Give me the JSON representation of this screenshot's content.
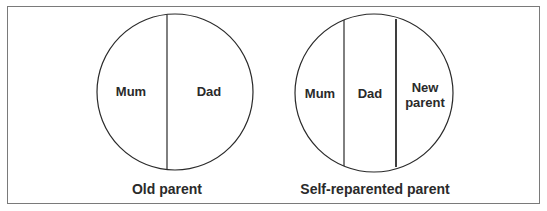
{
  "figure": {
    "panels": [
      {
        "caption": "Old parent",
        "segments": [
          {
            "label": "Mum"
          },
          {
            "label": "Dad"
          }
        ]
      },
      {
        "caption": "Self-reparented parent",
        "segments": [
          {
            "label": "Mum"
          },
          {
            "label": "Dad"
          },
          {
            "label_line1": "New",
            "label_line2": "parent"
          }
        ]
      }
    ]
  },
  "colors": {
    "stroke": "#2a2a2a",
    "frame": "#7a7a7a",
    "text": "#2a2a2a",
    "background": "#ffffff"
  }
}
